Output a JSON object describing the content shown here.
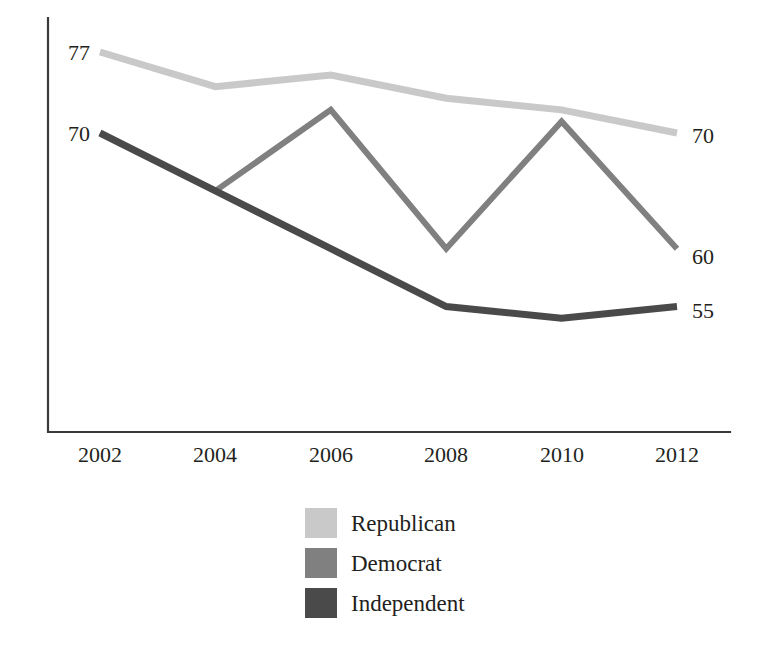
{
  "chart_data": {
    "type": "line",
    "title": "",
    "subtitle": "",
    "xlabel": "",
    "ylabel": "",
    "categories": [
      "2002",
      "2004",
      "2006",
      "2008",
      "2010",
      "2012"
    ],
    "x": [
      2002,
      2004,
      2006,
      2008,
      2010,
      2012
    ],
    "xlim": [
      2002,
      2012
    ],
    "ylim": [
      45,
      80
    ],
    "grid": false,
    "legend_position": "bottom-center",
    "series": [
      {
        "name": "Republican",
        "color": "#c9c9c9",
        "stroke_width": 7,
        "values": [
          77,
          74,
          75,
          73,
          72,
          70
        ],
        "start_label": "77",
        "end_label": "70"
      },
      {
        "name": "Democrat",
        "color": "#808080",
        "stroke_width": 6,
        "values": [
          70,
          65,
          72,
          60,
          71,
          60
        ],
        "start_label": "",
        "end_label": "60"
      },
      {
        "name": "Independent",
        "color": "#4a4a4a",
        "stroke_width": 7,
        "values": [
          70,
          65,
          60,
          55,
          54,
          55
        ],
        "start_label": "70",
        "end_label": "55"
      }
    ],
    "left_axis_labels": [
      "77",
      "70"
    ],
    "right_axis_labels": [
      "70",
      "60",
      "55"
    ]
  },
  "axis": {
    "x_tick_labels": [
      "2002",
      "2004",
      "2006",
      "2008",
      "2010",
      "2012"
    ],
    "left_labels": [
      {
        "text": "77",
        "series": "Republican"
      },
      {
        "text": "70",
        "series": "Independent"
      }
    ],
    "right_labels": [
      {
        "text": "70",
        "series": "Republican"
      },
      {
        "text": "60",
        "series": "Democrat"
      },
      {
        "text": "55",
        "series": "Independent"
      }
    ]
  },
  "legend": {
    "items": [
      {
        "label": "Republican",
        "color": "#c9c9c9"
      },
      {
        "label": "Democrat",
        "color": "#808080"
      },
      {
        "label": "Independent",
        "color": "#4a4a4a"
      }
    ]
  },
  "colors": {
    "background": "#ffffff",
    "axis": "#3a3a3a",
    "text": "#231f20",
    "republican": "#c9c9c9",
    "democrat": "#808080",
    "independent": "#4a4a4a"
  }
}
